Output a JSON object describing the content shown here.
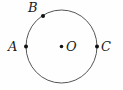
{
  "figure": {
    "type": "geometry-diagram",
    "background_color": "#fefefe",
    "stroke_color": "#555555",
    "dot_color": "#111111",
    "label_color": "#1a1a1a",
    "width": 123,
    "height": 90
  },
  "circle": {
    "center_x": 61.5,
    "center_y": 46.5,
    "radius_x": 35.5,
    "radius_y": 36.5,
    "stroke_width": 1
  },
  "points": [
    {
      "id": "B",
      "label": "B",
      "x": 43,
      "y": 16,
      "dot_radius": 2,
      "label_position": "upper-left"
    },
    {
      "id": "A",
      "label": "A",
      "x": 26,
      "y": 46.5,
      "dot_radius": 2,
      "label_position": "left"
    },
    {
      "id": "O",
      "label": "O",
      "x": 61.5,
      "y": 46.5,
      "dot_radius": 1.8,
      "label_position": "right"
    },
    {
      "id": "C",
      "label": "C",
      "x": 97,
      "y": 46.5,
      "dot_radius": 2,
      "label_position": "right"
    }
  ]
}
